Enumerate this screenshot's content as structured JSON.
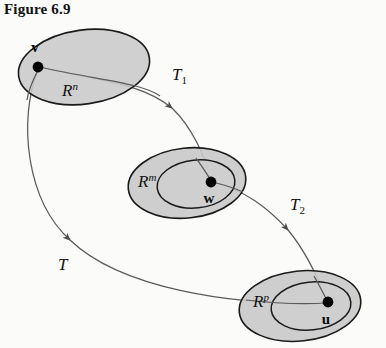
{
  "figure": {
    "title": "Figure 6.9",
    "caption_number": "6.9"
  },
  "colors": {
    "background": "#fbfbfa",
    "ellipse_fill": "#c9c9c9",
    "inner_ellipse_fill": "#cccccc",
    "ellipse_stroke": "#1a1a1a",
    "curve_stroke": "#555555",
    "text": "#111111",
    "dot": "#000000"
  },
  "diagram": {
    "type": "commutative-mapping-diagram",
    "spaces": [
      {
        "id": "domain",
        "label": "R",
        "superscript": "n",
        "label_full": "R^n",
        "vector_label": "v",
        "has_inner_ellipse": false,
        "cx": 84,
        "cy": 67,
        "rx": 66,
        "ry": 37,
        "rotation": -8,
        "dot_x": 38,
        "dot_y": 67,
        "label_x": 62,
        "label_y": 95,
        "vector_x": 41,
        "vector_y": 50
      },
      {
        "id": "intermediate",
        "label": "R",
        "superscript": "m",
        "label_full": "R^m",
        "vector_label": "w",
        "has_inner_ellipse": true,
        "cx": 187,
        "cy": 183,
        "rx": 59,
        "ry": 35,
        "rotation": -6,
        "inner_rx": 39,
        "inner_ry": 24,
        "inner_cx": 196,
        "inner_cy": 184,
        "dot_x": 211,
        "dot_y": 182,
        "label_x": 141,
        "label_y": 186,
        "vector_x": 205,
        "vector_y": 201
      },
      {
        "id": "codomain",
        "label": "R",
        "superscript": "p",
        "label_full": "R^p",
        "vector_label": "u",
        "has_inner_ellipse": true,
        "cx": 300,
        "cy": 306,
        "rx": 61,
        "ry": 35,
        "rotation": -6,
        "inner_rx": 40,
        "inner_ry": 24,
        "inner_cx": 310,
        "inner_cy": 306,
        "dot_x": 328,
        "dot_y": 302,
        "label_x": 256,
        "label_y": 306,
        "vector_x": 324,
        "vector_y": 323
      }
    ],
    "maps": [
      {
        "id": "T1",
        "label": "T",
        "subscript": "1",
        "label_full": "T_1",
        "from": "domain",
        "to": "intermediate",
        "label_x": 178,
        "label_y": 78
      },
      {
        "id": "T2",
        "label": "T",
        "subscript": "2",
        "label_full": "T_2",
        "from": "intermediate",
        "to": "codomain",
        "label_x": 295,
        "label_y": 208
      },
      {
        "id": "T",
        "label": "T",
        "subscript": "",
        "label_full": "T",
        "from": "domain",
        "to": "codomain",
        "label_x": 62,
        "label_y": 268
      }
    ]
  }
}
